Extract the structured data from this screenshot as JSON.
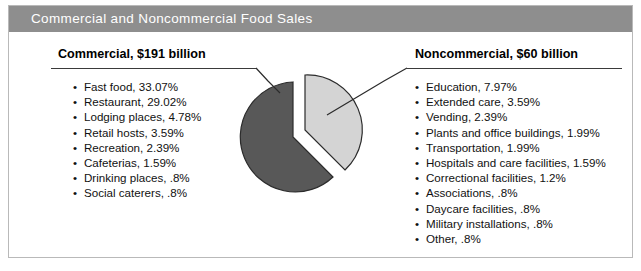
{
  "figure": {
    "title": "Commercial and Noncommercial Food Sales"
  },
  "left_panel": {
    "heading": "Commercial, $191 billion",
    "bullet": "•",
    "items": [
      "Fast food, 33.07%",
      "Restaurant, 29.02%",
      "Lodging places, 4.78%",
      "Retail hosts, 3.59%",
      "Recreation, 2.39%",
      "Cafeterias, 1.59%",
      "Drinking places, .8%",
      "Social caterers, .8%"
    ]
  },
  "right_panel": {
    "heading": "Noncommercial, $60 billion",
    "bullet": "•",
    "items": [
      "Education, 7.97%",
      "Extended care, 3.59%",
      "Vending, 2.39%",
      "Plants and office buildings, 1.99%",
      "Transportation, 1.99%",
      "Hospitals and care facilities, 1.59%",
      "Correctional facilities, 1.2%",
      "Associations, .8%",
      "Daycare facilities, .8%",
      "Military installations, .8%",
      "Other, .8%"
    ]
  },
  "colors": {
    "title_band": "#8e8e8e",
    "title_text": "#ffffff",
    "frame_border": "#b9b9b9",
    "commercial_slice": "#585858",
    "noncommercial_slice": "#d4d4d4",
    "slice_outline": "#2b2b2b",
    "leader_line": "#2b2b2b",
    "background": "#ffffff"
  },
  "chart_data": {
    "type": "pie",
    "title": "Commercial and Noncommercial Food Sales",
    "labels": [
      "Commercial",
      "Noncommercial"
    ],
    "values": [
      76.12,
      23.88
    ],
    "value_labels": [
      "$191 billion",
      "$60 billion"
    ],
    "colors": [
      "#585858",
      "#d4d4d4"
    ],
    "exploded": [
      false,
      true
    ],
    "start_angle_deg": 0,
    "legend": "none",
    "grid": false,
    "breakdown": [
      {
        "group": "Commercial",
        "total_label": "$191 billion",
        "segments": [
          {
            "label": "Fast food",
            "value": 33.07
          },
          {
            "label": "Restaurant",
            "value": 29.02
          },
          {
            "label": "Lodging places",
            "value": 4.78
          },
          {
            "label": "Retail hosts",
            "value": 3.59
          },
          {
            "label": "Recreation",
            "value": 2.39
          },
          {
            "label": "Cafeterias",
            "value": 1.59
          },
          {
            "label": "Drinking places",
            "value": 0.8
          },
          {
            "label": "Social caterers",
            "value": 0.8
          }
        ]
      },
      {
        "group": "Noncommercial",
        "total_label": "$60 billion",
        "segments": [
          {
            "label": "Education",
            "value": 7.97
          },
          {
            "label": "Extended care",
            "value": 3.59
          },
          {
            "label": "Vending",
            "value": 2.39
          },
          {
            "label": "Plants and office buildings",
            "value": 1.99
          },
          {
            "label": "Transportation",
            "value": 1.99
          },
          {
            "label": "Hospitals and care facilities",
            "value": 1.59
          },
          {
            "label": "Correctional facilities",
            "value": 1.2
          },
          {
            "label": "Associations",
            "value": 0.8
          },
          {
            "label": "Daycare facilities",
            "value": 0.8
          },
          {
            "label": "Military installations",
            "value": 0.8
          },
          {
            "label": "Other",
            "value": 0.8
          }
        ]
      }
    ],
    "units": "percent of total food sales"
  }
}
